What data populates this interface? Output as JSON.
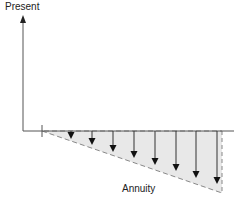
{
  "diagram": {
    "y_axis_label": "Present",
    "annuity_label": "Annuity",
    "colors": {
      "axis": "#555555",
      "fill": "#e8e8e8",
      "dash": "#888888",
      "arrow": "#333333"
    },
    "arrows": [
      {
        "x": 71,
        "y_end": 139
      },
      {
        "x": 92,
        "y_end": 145
      },
      {
        "x": 113,
        "y_end": 152
      },
      {
        "x": 134,
        "y_end": 158
      },
      {
        "x": 155,
        "y_end": 165
      },
      {
        "x": 176,
        "y_end": 171
      },
      {
        "x": 196,
        "y_end": 178
      },
      {
        "x": 217,
        "y_end": 184
      }
    ]
  }
}
